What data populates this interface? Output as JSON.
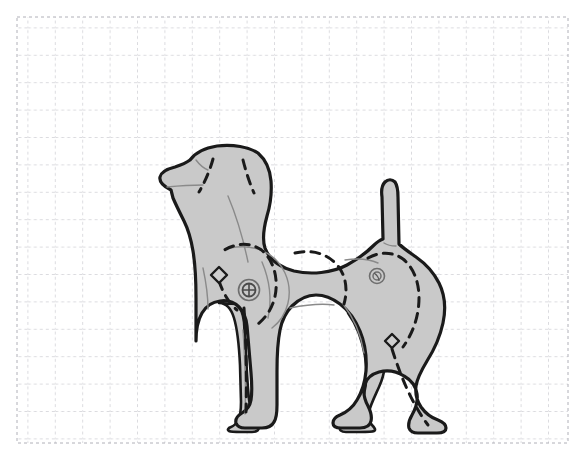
{
  "canvas": {
    "width": 587,
    "height": 469,
    "background_color": "#ffffff",
    "title": "Articulated dog figure pattern on dashed graph grid"
  },
  "grid": {
    "name": "dashed-graph-grid",
    "x": 17,
    "y": 17,
    "width": 551,
    "height": 426,
    "cell_size": 27.4,
    "line_color": "#b8b8c0",
    "line_style": "dashed",
    "dash_pattern": "3 3",
    "line_width": 1,
    "columns": 20,
    "rows": 15.5,
    "border_color": "#b0b0b8"
  },
  "figure": {
    "name": "dog-silhouette",
    "pose": "standing, side profile, facing left",
    "style": "jointed wooden / plush pattern diagram",
    "fill_color": "#c9c9c9",
    "outline_color": "#1a1a1a",
    "outline_width": 3,
    "seam_color": "#1a1a1a",
    "seam_style": "dashed",
    "seam_dash_pattern": "9 7",
    "seam_width": 3,
    "inner_line_color": "#8a8a8a",
    "inner_line_width": 1.4,
    "bounds": {
      "left": 158,
      "top": 145,
      "right": 448,
      "bottom": 432
    }
  },
  "parts": [
    {
      "name": "head",
      "label": "Head"
    },
    {
      "name": "muzzle",
      "label": "Muzzle"
    },
    {
      "name": "mouth-line",
      "label": "Mouth line"
    },
    {
      "name": "ear",
      "label": "Ear"
    },
    {
      "name": "neck",
      "label": "Neck"
    },
    {
      "name": "body",
      "label": "Body / torso"
    },
    {
      "name": "tail",
      "label": "Tail"
    },
    {
      "name": "front-leg-near",
      "label": "Front leg (near)"
    },
    {
      "name": "front-leg-far",
      "label": "Front leg (far)"
    },
    {
      "name": "rear-leg-near",
      "label": "Rear leg (near)"
    },
    {
      "name": "rear-leg-far",
      "label": "Rear leg (far)"
    },
    {
      "name": "front-paw",
      "label": "Front paw"
    },
    {
      "name": "rear-paw",
      "label": "Rear paw"
    }
  ],
  "joints": [
    {
      "name": "shoulder-joint",
      "label": "Shoulder joint",
      "cx": 249,
      "cy": 290,
      "outer_radius": 10.5,
      "inner_radius": 6.5,
      "marker": "crosshair",
      "stroke_color": "#6e6e6e"
    },
    {
      "name": "hip-joint",
      "label": "Hip joint",
      "cx": 377,
      "cy": 276,
      "outer_radius": 7.5,
      "inner_radius": 4,
      "marker": "inner-circle",
      "stroke_color": "#6e6e6e"
    }
  ],
  "markers": [
    {
      "name": "chest-diamond-marker",
      "label": "Chest seam diamond",
      "cx": 219,
      "cy": 275,
      "size": 8,
      "shape": "diamond",
      "stroke_color": "#1a1a1a"
    },
    {
      "name": "rear-leg-diamond-marker",
      "label": "Rear leg seam diamond",
      "cx": 392,
      "cy": 341,
      "size": 7,
      "shape": "diamond",
      "stroke_color": "#1a1a1a"
    }
  ],
  "seams": [
    {
      "name": "ear-seam-left",
      "label": "Ear seam left"
    },
    {
      "name": "ear-seam-right",
      "label": "Ear seam right"
    },
    {
      "name": "shoulder-seam",
      "label": "Shoulder panel seam"
    },
    {
      "name": "back-seam",
      "label": "Back / flank seam"
    },
    {
      "name": "front-leg-seam",
      "label": "Front leg seam"
    },
    {
      "name": "rear-leg-seam",
      "label": "Rear leg seam"
    }
  ],
  "shapes": {
    "body_outline": "M 171 190 C 163 185 159 181 160 177 C 161 172 168 168 176 166 C 182 164 188 162 192 159 C 197 153 205 148 218 146 C 234 144 250 147 259 153 C 267 159 271 168 272 180 C 273 193 271 205 268 215 C 265 226 263 238 266 247 C 270 258 280 266 295 270 C 312 274 333 272 348 264 C 359 258 368 251 374 245 C 378 241 381 239 384 238 L 383 196 C 382 189 383 184 386 181 C 389 178 393 178 396 181 C 398 184 399 189 399 196 L 400 243 C 404 247 410 251 417 256 C 427 263 435 272 440 282 C 446 294 447 308 444 322 C 441 336 435 349 428 360 C 422 370 418 378 417 385 C 416 393 418 400 422 406 C 427 413 433 417 439 419 C 444 421 447 424 447 427 C 447 430 444 432 438 432 L 419 432 C 414 432 411 430 410 427 C 409 423 410 419 413 414 C 417 407 419 400 418 393 C 417 385 412 379 405 375 C 397 370 388 369 380 371 C 373 373 368 377 366 383 C 364 390 365 398 369 405 C 372 411 373 416 372 420 C 371 425 367 427 361 427 L 342 427 C 337 427 334 425 334 422 C 334 419 336 416 341 414 C 348 411 354 406 358 399 C 363 391 366 381 367 370 C 368 356 366 342 361 330 C 356 318 349 309 341 303 C 333 297 325 294 317 294 C 308 294 300 298 293 305 C 287 311 283 319 281 329 C 279 339 278 353 278 370 L 278 404 C 278 412 277 418 275 421 C 273 425 269 427 263 427 L 246 427 C 241 427 238 425 237 422 C 236 418 238 415 243 412 C 248 409 251 405 252 399 C 253 393 253 384 252 372 L 248 325 C 247 316 244 310 240 306 C 235 301 228 299 221 300 C 213 301 207 305 203 312 C 199 319 197 328 197 340 L 197 297 C 197 278 196 262 194 250 C 192 238 189 228 185 220 C 181 212 177 204 174 197 Z"
  }
}
